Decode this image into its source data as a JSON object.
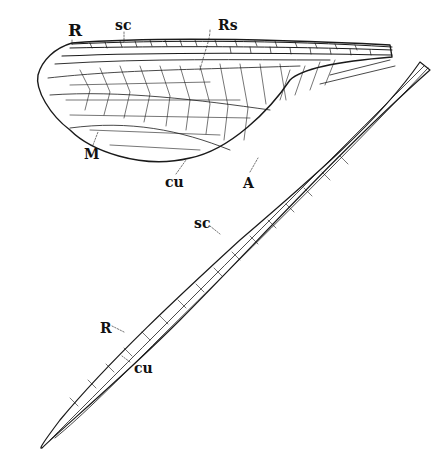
{
  "figure": {
    "background": "#ffffff",
    "ink": "#1a1a1a"
  },
  "broad_wing": {
    "labels": [
      {
        "id": "R",
        "text": "R",
        "x": 68,
        "y": 22
      },
      {
        "id": "sc",
        "text": "sc",
        "x": 115,
        "y": 18
      },
      {
        "id": "Rs",
        "text": "Rs",
        "x": 218,
        "y": 18
      },
      {
        "id": "M",
        "text": "M",
        "x": 84,
        "y": 147
      },
      {
        "id": "cu",
        "text": "cu",
        "x": 165,
        "y": 175
      },
      {
        "id": "A",
        "text": "A",
        "x": 243,
        "y": 176
      }
    ]
  },
  "narrow_wing": {
    "labels": [
      {
        "id": "sc",
        "text": "sc",
        "x": 194,
        "y": 216
      },
      {
        "id": "R",
        "text": "R",
        "x": 100,
        "y": 321
      },
      {
        "id": "cu",
        "text": "cu",
        "x": 134,
        "y": 361
      }
    ]
  }
}
